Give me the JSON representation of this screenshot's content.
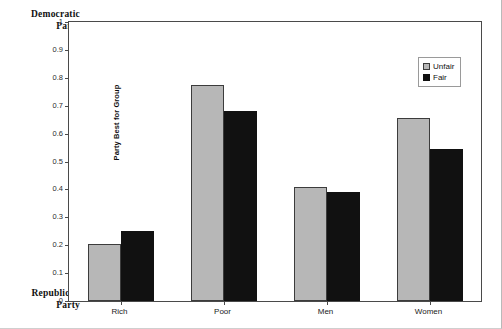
{
  "annotations": {
    "top_pole_line1": "Democratic",
    "top_pole_line2": "Party",
    "bottom_pole_line1": "Republican",
    "bottom_pole_line2": "Party"
  },
  "legend": {
    "position": "top-right-inside",
    "items": [
      {
        "label": "Unfair",
        "color": "#b7b7b7",
        "swatch": "unfair-swatch-icon"
      },
      {
        "label": "Fair",
        "color": "#111111",
        "swatch": "fair-swatch-icon"
      }
    ]
  },
  "chart_data": {
    "type": "bar",
    "title": "",
    "xlabel": "",
    "ylabel": "Party Best for Group",
    "categories": [
      "Rich",
      "Poor",
      "Men",
      "Women"
    ],
    "series": [
      {
        "name": "Unfair",
        "color": "#b7b7b7",
        "values": [
          0.205,
          0.775,
          0.41,
          0.655
        ]
      },
      {
        "name": "Fair",
        "color": "#111111",
        "values": [
          0.25,
          0.68,
          0.39,
          0.545
        ]
      }
    ],
    "ylim": [
      0,
      1
    ],
    "yticks": [
      0,
      0.1,
      0.2,
      0.3,
      0.4,
      0.5,
      0.6,
      0.7,
      0.8,
      0.9,
      1
    ],
    "ytick_labels": [
      "0",
      "0.1",
      "0.2",
      "0.3",
      "0.4",
      "0.5",
      "0.6",
      "0.7",
      "0.8",
      "0.9",
      "1"
    ],
    "grid": false,
    "legend_position": "upper right",
    "annotations": [
      {
        "text": "Democratic Party",
        "at": "y-axis-top"
      },
      {
        "text": "Republican Party",
        "at": "y-axis-bottom"
      }
    ]
  }
}
